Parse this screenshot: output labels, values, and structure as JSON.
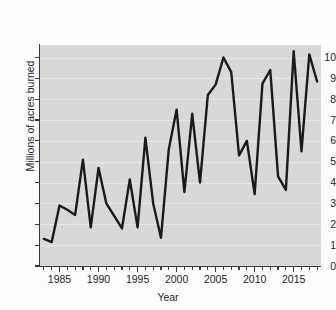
{
  "chart_data": {
    "type": "line",
    "title": "",
    "xlabel": "Year",
    "ylabel": "Millions of acres burned",
    "xlim": [
      1982.5,
      2018.5
    ],
    "ylim": [
      0,
      10.6
    ],
    "grid": true,
    "legend": "none",
    "x_ticks_major": [
      1985,
      1990,
      1995,
      2000,
      2005,
      2010,
      2015
    ],
    "x_tick_labels": [
      "1985",
      "1990",
      "1995",
      "2000",
      "2005",
      "2010",
      "2015"
    ],
    "x_tick_minor_step": 1,
    "y_ticks": [
      0,
      1,
      2,
      3,
      4,
      5,
      6,
      7,
      8,
      9,
      10
    ],
    "y_tick_labels": [
      "0",
      "1",
      "2",
      "3",
      "4",
      "5",
      "6",
      "7",
      "8",
      "9",
      "10"
    ],
    "line_color": "#1a1a1a",
    "line_width": 2.4,
    "plot_background": "#d8d8d8",
    "x": [
      1983,
      1984,
      1985,
      1986,
      1987,
      1988,
      1989,
      1990,
      1991,
      1992,
      1993,
      1994,
      1995,
      1996,
      1997,
      1998,
      1999,
      2000,
      2001,
      2002,
      2003,
      2004,
      2005,
      2006,
      2007,
      2008,
      2009,
      2010,
      2011,
      2012,
      2013,
      2014,
      2015,
      2016,
      2017,
      2018
    ],
    "values": [
      1.3,
      1.15,
      2.9,
      2.7,
      2.45,
      5.1,
      1.85,
      4.7,
      3.0,
      2.4,
      1.8,
      4.15,
      1.85,
      6.15,
      3.0,
      1.35,
      5.6,
      7.5,
      3.55,
      7.3,
      4.0,
      8.2,
      8.7,
      10.0,
      9.3,
      5.3,
      6.0,
      3.45,
      8.75,
      9.4,
      4.3,
      3.65,
      10.3,
      5.5,
      10.15,
      8.85
    ],
    "series_name": "Acres burned"
  },
  "axis": {
    "x_title": "Year",
    "y_title": "Millions of acres burned"
  }
}
